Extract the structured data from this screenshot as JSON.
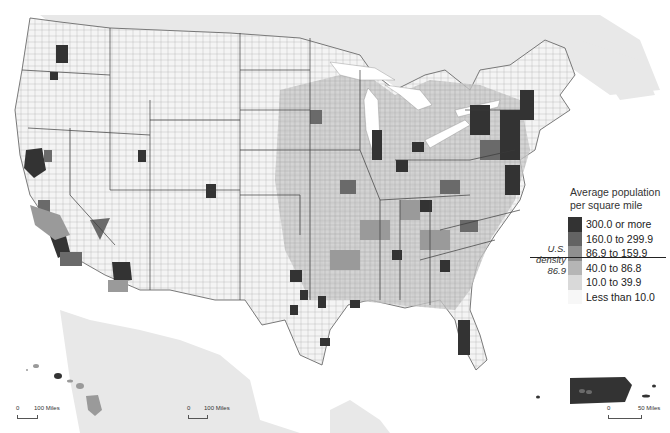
{
  "map": {
    "subject": "Population density by county, United States and Puerto Rico",
    "colors": {
      "background": "#ffffff",
      "land_outside": "#e6e6e6",
      "water": "#ffffff",
      "county_border": "#9a9a9a",
      "state_border": "#3a3a3a"
    }
  },
  "legend": {
    "title_line1": "Average population",
    "title_line2": "per square mile",
    "classes": [
      {
        "label": "300.0 or more",
        "color": "#333333"
      },
      {
        "label": "160.0 to 299.9",
        "color": "#636363"
      },
      {
        "label": "86.9 to 159.9",
        "color": "#8f8f8f"
      },
      {
        "label": "40.0 to 86.8",
        "color": "#b5b5b5"
      },
      {
        "label": "10.0 to 39.9",
        "color": "#d9d9d9"
      },
      {
        "label": "Less than 10.0",
        "color": "#f7f7f7"
      }
    ]
  },
  "density_note": {
    "line1": "U.S.",
    "line2": "density",
    "line3": "86.9"
  },
  "scale_bars": [
    {
      "name": "alaska-scale",
      "start": "0",
      "end": "100 Miles"
    },
    {
      "name": "hawaii-scale",
      "start": "0",
      "end": "100 Miles"
    },
    {
      "name": "puerto-rico-scale",
      "start": "0",
      "end": "50 Miles"
    }
  ]
}
